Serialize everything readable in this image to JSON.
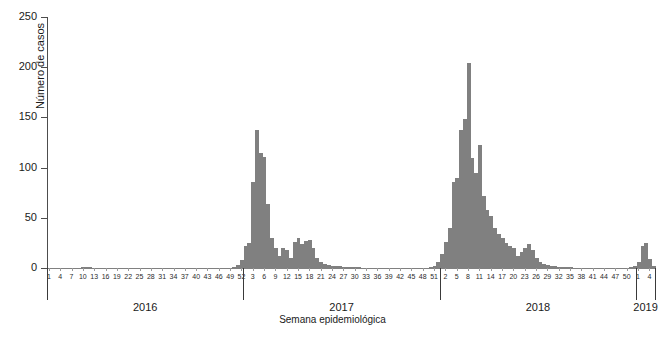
{
  "chart_data": {
    "type": "bar",
    "title": "",
    "subtitle": "",
    "xlabel": "Semana epidemiológica",
    "ylabel": "Número de casos",
    "ylim": [
      0,
      250
    ],
    "y_ticks": [
      0,
      50,
      100,
      150,
      200,
      250
    ],
    "grid": false,
    "legend": null,
    "bar_color": "#808080",
    "axis_color": "#4d4d4d",
    "x_group_label_key": "year",
    "annotations": [],
    "groups": [
      {
        "year": "2016",
        "tick_weeks": [
          1,
          4,
          7,
          10,
          13,
          16,
          19,
          22,
          25,
          28,
          31,
          34,
          37,
          40,
          43,
          46,
          49,
          52
        ]
      },
      {
        "year": "2017",
        "tick_weeks": [
          3,
          6,
          9,
          12,
          15,
          18,
          21,
          24,
          27,
          30,
          33,
          36,
          39,
          42,
          45,
          48,
          51
        ]
      },
      {
        "year": "2018",
        "tick_weeks": [
          2,
          5,
          8,
          11,
          14,
          17,
          20,
          23,
          26,
          29,
          32,
          35,
          38,
          41,
          44,
          47,
          50
        ]
      },
      {
        "year": "2019",
        "tick_weeks": [
          1,
          4
        ]
      }
    ],
    "categories": [
      "2016-W1",
      "2016-W2",
      "2016-W3",
      "2016-W4",
      "2016-W5",
      "2016-W6",
      "2016-W7",
      "2016-W8",
      "2016-W9",
      "2016-W10",
      "2016-W11",
      "2016-W12",
      "2016-W13",
      "2016-W14",
      "2016-W15",
      "2016-W16",
      "2016-W17",
      "2016-W18",
      "2016-W19",
      "2016-W20",
      "2016-W21",
      "2016-W22",
      "2016-W23",
      "2016-W24",
      "2016-W25",
      "2016-W26",
      "2016-W27",
      "2016-W28",
      "2016-W29",
      "2016-W30",
      "2016-W31",
      "2016-W32",
      "2016-W33",
      "2016-W34",
      "2016-W35",
      "2016-W36",
      "2016-W37",
      "2016-W38",
      "2016-W39",
      "2016-W40",
      "2016-W41",
      "2016-W42",
      "2016-W43",
      "2016-W44",
      "2016-W45",
      "2016-W46",
      "2016-W47",
      "2016-W48",
      "2016-W49",
      "2016-W50",
      "2016-W51",
      "2016-W52",
      "2017-W1",
      "2017-W2",
      "2017-W3",
      "2017-W4",
      "2017-W5",
      "2017-W6",
      "2017-W7",
      "2017-W8",
      "2017-W9",
      "2017-W10",
      "2017-W11",
      "2017-W12",
      "2017-W13",
      "2017-W14",
      "2017-W15",
      "2017-W16",
      "2017-W17",
      "2017-W18",
      "2017-W19",
      "2017-W20",
      "2017-W21",
      "2017-W22",
      "2017-W23",
      "2017-W24",
      "2017-W25",
      "2017-W26",
      "2017-W27",
      "2017-W28",
      "2017-W29",
      "2017-W30",
      "2017-W31",
      "2017-W32",
      "2017-W33",
      "2017-W34",
      "2017-W35",
      "2017-W36",
      "2017-W37",
      "2017-W38",
      "2017-W39",
      "2017-W40",
      "2017-W41",
      "2017-W42",
      "2017-W43",
      "2017-W44",
      "2017-W45",
      "2017-W46",
      "2017-W47",
      "2017-W48",
      "2017-W49",
      "2017-W50",
      "2017-W51",
      "2017-W52",
      "2018-W1",
      "2018-W2",
      "2018-W3",
      "2018-W4",
      "2018-W5",
      "2018-W6",
      "2018-W7",
      "2018-W8",
      "2018-W9",
      "2018-W10",
      "2018-W11",
      "2018-W12",
      "2018-W13",
      "2018-W14",
      "2018-W15",
      "2018-W16",
      "2018-W17",
      "2018-W18",
      "2018-W19",
      "2018-W20",
      "2018-W21",
      "2018-W22",
      "2018-W23",
      "2018-W24",
      "2018-W25",
      "2018-W26",
      "2018-W27",
      "2018-W28",
      "2018-W29",
      "2018-W30",
      "2018-W31",
      "2018-W32",
      "2018-W33",
      "2018-W34",
      "2018-W35",
      "2018-W36",
      "2018-W37",
      "2018-W38",
      "2018-W39",
      "2018-W40",
      "2018-W41",
      "2018-W42",
      "2018-W43",
      "2018-W44",
      "2018-W45",
      "2018-W46",
      "2018-W47",
      "2018-W48",
      "2018-W49",
      "2018-W50",
      "2018-W51",
      "2018-W52",
      "2019-W1",
      "2019-W2",
      "2019-W3",
      "2019-W4",
      "2019-W5"
    ],
    "values": [
      0,
      0,
      0,
      0,
      0,
      0,
      0,
      0,
      0,
      1,
      1,
      1,
      0,
      0,
      0,
      0,
      0,
      0,
      0,
      0,
      0,
      0,
      0,
      0,
      0,
      0,
      0,
      0,
      0,
      0,
      0,
      0,
      0,
      0,
      0,
      0,
      0,
      0,
      0,
      0,
      0,
      0,
      0,
      0,
      0,
      0,
      0,
      0,
      0,
      1,
      3,
      8,
      22,
      25,
      86,
      137,
      115,
      111,
      64,
      30,
      20,
      12,
      20,
      18,
      10,
      26,
      30,
      24,
      27,
      28,
      20,
      10,
      6,
      4,
      3,
      2,
      2,
      2,
      1,
      1,
      1,
      1,
      1,
      0,
      0,
      0,
      0,
      0,
      0,
      0,
      0,
      0,
      0,
      0,
      0,
      0,
      0,
      0,
      0,
      0,
      0,
      1,
      2,
      6,
      14,
      26,
      40,
      86,
      90,
      137,
      148,
      204,
      110,
      95,
      123,
      72,
      58,
      52,
      40,
      34,
      30,
      25,
      22,
      20,
      12,
      16,
      20,
      24,
      18,
      10,
      6,
      4,
      3,
      2,
      2,
      1,
      1,
      1,
      1,
      0,
      0,
      0,
      0,
      0,
      0,
      0,
      0,
      0,
      0,
      0,
      0,
      0,
      0,
      0,
      1,
      2,
      6,
      22,
      25,
      9,
      2
    ],
    "peaks": [
      {
        "label": "2017-W4",
        "value": 137
      },
      {
        "label": "2018-W8",
        "value": 204
      },
      {
        "label": "2018-W11",
        "value": 123
      }
    ]
  }
}
